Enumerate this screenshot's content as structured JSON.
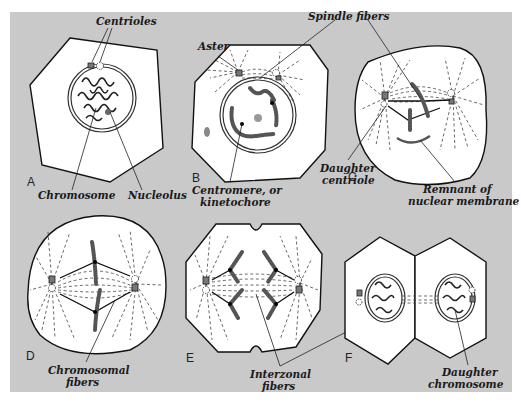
{
  "figure": {
    "background_color": "#c9c9c9",
    "panels": [
      {
        "letter": "A",
        "labels": [
          "Centrioles",
          "Chromosome",
          "Nucleolus"
        ]
      },
      {
        "letter": "B",
        "labels": [
          "Aster",
          "Spindle fibers",
          "Centromere, or",
          "kinetochore"
        ]
      },
      {
        "letter": "C",
        "labels": [
          "Daughter",
          "centriole",
          "Remnant of",
          "nuclear membrane"
        ]
      },
      {
        "letter": "D",
        "labels": [
          "Chromosomal",
          "fibers"
        ]
      },
      {
        "letter": "E",
        "labels": [
          "Interzonal",
          "fibers"
        ]
      },
      {
        "letter": "F",
        "labels": [
          "Daughter",
          "chromosome"
        ]
      }
    ]
  }
}
